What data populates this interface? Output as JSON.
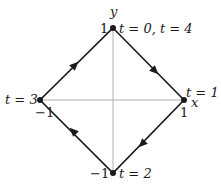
{
  "diagram": {
    "axes": {
      "x_label": "x",
      "y_label": "y",
      "color": "#b0b0b0"
    },
    "path": {
      "shape": "diamond |x|+|y|=1",
      "color": "#1a1a1a",
      "direction": "clockwise"
    },
    "vertices": [
      {
        "name": "top",
        "coord": [
          0,
          1
        ],
        "tick_label": "1",
        "t_label": "t = 0, t = 4"
      },
      {
        "name": "right",
        "coord": [
          1,
          0
        ],
        "tick_label": "1",
        "t_label": "t = 1"
      },
      {
        "name": "bottom",
        "coord": [
          0,
          -1
        ],
        "tick_label": "−1",
        "t_label": "t = 2"
      },
      {
        "name": "left",
        "coord": [
          -1,
          0
        ],
        "tick_label": "−1",
        "t_label": "t = 3"
      }
    ]
  }
}
